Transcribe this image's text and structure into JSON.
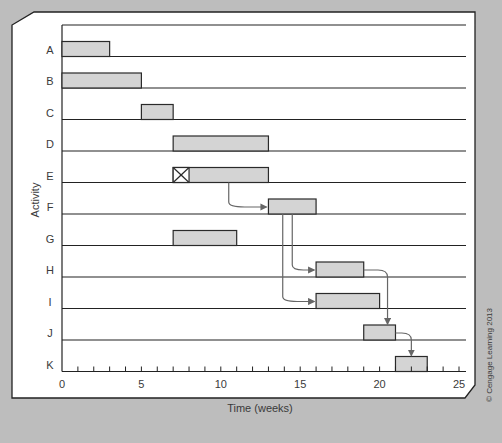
{
  "chart_data": {
    "type": "gantt",
    "title": "",
    "xlabel": "Time (weeks)",
    "ylabel": "Activity",
    "xlim": [
      0,
      25
    ],
    "x_ticks": [
      0,
      5,
      10,
      15,
      20,
      25
    ],
    "minor_tick_step": 1,
    "categories": [
      "A",
      "B",
      "C",
      "D",
      "E",
      "F",
      "G",
      "H",
      "I",
      "J",
      "K"
    ],
    "tasks": [
      {
        "activity": "A",
        "start": 0,
        "end": 3
      },
      {
        "activity": "B",
        "start": 0,
        "end": 5
      },
      {
        "activity": "C",
        "start": 5,
        "end": 7
      },
      {
        "activity": "D",
        "start": 7,
        "end": 13
      },
      {
        "activity": "E",
        "start": 7,
        "end": 13,
        "crossed_box": [
          7,
          8
        ]
      },
      {
        "activity": "F",
        "start": 13,
        "end": 16
      },
      {
        "activity": "G",
        "start": 7,
        "end": 11
      },
      {
        "activity": "H",
        "start": 16,
        "end": 19
      },
      {
        "activity": "I",
        "start": 16,
        "end": 20
      },
      {
        "activity": "J",
        "start": 19,
        "end": 21
      },
      {
        "activity": "K",
        "start": 21,
        "end": 23
      }
    ],
    "dependencies": [
      {
        "from": "E",
        "to": "F"
      },
      {
        "from": "F",
        "to": "H"
      },
      {
        "from": "F",
        "to": "I"
      },
      {
        "from": "H",
        "to": "J"
      },
      {
        "from": "J",
        "to": "K"
      }
    ],
    "colors": {
      "bar_fill": "#d4d4d4",
      "bar_stroke": "#2a2a2a",
      "arrow": "#666666",
      "background": "#bdbdbd",
      "panel": "#ffffff"
    }
  },
  "copyright": "© Cengage Learning 2013"
}
